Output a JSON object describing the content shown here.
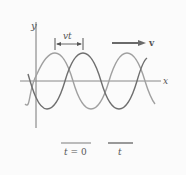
{
  "diagram": {
    "axes": {
      "x_label": "x",
      "y_label": "y"
    },
    "displacement_label": "vt",
    "velocity_label": "v",
    "colors": {
      "wave_t0": "#a0a0a0",
      "wave_t": "#6f6f6f",
      "axis": "#777777",
      "arrow": "#6a6a6a",
      "background": "#fbfbfb"
    },
    "legend": [
      {
        "label_var": "t",
        "label_rest": " = 0",
        "series": "wave_t0"
      },
      {
        "label_var": "t",
        "label_rest": "",
        "series": "wave_t"
      }
    ]
  }
}
